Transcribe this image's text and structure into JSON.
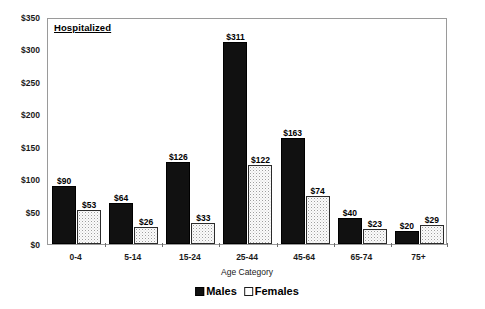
{
  "panel": {
    "title": "Hospitalized"
  },
  "axes": {
    "y_tick_labels": [
      "$0",
      "$50",
      "$100",
      "$150",
      "$200",
      "$250",
      "$300",
      "$350"
    ],
    "x_axis_title": "Age Category"
  },
  "legend": {
    "entries": [
      {
        "label": "Males",
        "swatch": "filled-black-square"
      },
      {
        "label": "Females",
        "swatch": "open-dotted-square"
      }
    ]
  },
  "chart_data": {
    "type": "bar",
    "title": "Hospitalized",
    "xlabel": "Age Category",
    "ylabel": "",
    "ylim": [
      0,
      350
    ],
    "ytick_step": 50,
    "ytick_prefix": "$",
    "grid": false,
    "legend_position": "bottom-center",
    "categories": [
      "0-4",
      "5-14",
      "15-24",
      "25-44",
      "45-64",
      "65-74",
      "75+"
    ],
    "series": [
      {
        "name": "Males",
        "color": "#111111",
        "values": [
          90,
          64,
          126,
          311,
          163,
          40,
          20
        ],
        "labels": [
          "$90",
          "$64",
          "$126",
          "$311",
          "$163",
          "$40",
          "$20"
        ]
      },
      {
        "name": "Females",
        "color": "#ffffff",
        "values": [
          53,
          26,
          33,
          122,
          74,
          23,
          29
        ],
        "labels": [
          "$53",
          "$26",
          "$33",
          "$122",
          "$74",
          "$23",
          "$29"
        ]
      }
    ]
  }
}
